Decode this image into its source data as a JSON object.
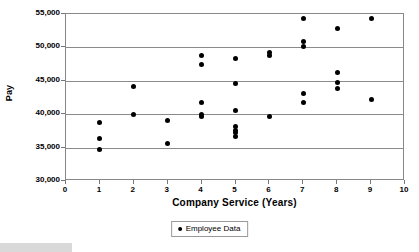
{
  "chart_data": {
    "type": "scatter",
    "title": "",
    "xlabel": "Company Service (Years)",
    "ylabel": "Pay",
    "xlim": [
      0,
      10
    ],
    "ylim": [
      30000,
      55000
    ],
    "xticks": [
      0,
      1,
      2,
      3,
      4,
      5,
      6,
      7,
      8,
      9,
      10
    ],
    "xtick_labels": [
      "0",
      "1",
      "2",
      "3",
      "4",
      "5",
      "6",
      "7",
      "8",
      "9",
      "10"
    ],
    "yticks": [
      30000,
      35000,
      40000,
      45000,
      50000,
      55000
    ],
    "ytick_labels": [
      "30,000",
      "35,000",
      "40,000",
      "45,000",
      "50,000",
      "55,000"
    ],
    "grid": "horizontal",
    "legend_position": "bottom-center",
    "marker_color": "#000000",
    "grid_color": "#8a8a8a",
    "series": [
      {
        "name": "Employee Data",
        "marker": "circle",
        "color": "#000000",
        "points": [
          [
            1,
            38700
          ],
          [
            1,
            36300
          ],
          [
            1,
            34700
          ],
          [
            2,
            44100
          ],
          [
            2,
            39900
          ],
          [
            3,
            39100
          ],
          [
            3,
            35600
          ],
          [
            4,
            48800
          ],
          [
            4,
            47400
          ],
          [
            4,
            41700
          ],
          [
            4,
            40000
          ],
          [
            4,
            39600
          ],
          [
            5,
            48300
          ],
          [
            5,
            44600
          ],
          [
            5,
            40500
          ],
          [
            5,
            38100
          ],
          [
            5,
            37500
          ],
          [
            5,
            37200
          ],
          [
            5,
            36600
          ],
          [
            6,
            49200
          ],
          [
            6,
            48800
          ],
          [
            6,
            39700
          ],
          [
            7,
            54300
          ],
          [
            7,
            50900
          ],
          [
            7,
            50200
          ],
          [
            7,
            43100
          ],
          [
            7,
            41800
          ],
          [
            8,
            52800
          ],
          [
            8,
            46200
          ],
          [
            8,
            44700
          ],
          [
            8,
            43800
          ],
          [
            9,
            54300
          ],
          [
            9,
            42200
          ]
        ]
      }
    ]
  },
  "legend": {
    "entries": [
      {
        "label": "Employee Data",
        "marker": "legend-marker-dot"
      }
    ]
  }
}
